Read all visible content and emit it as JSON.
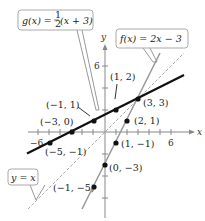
{
  "figure": {
    "axes": {
      "x_label": "x",
      "y_label": "y",
      "x_ticks": [
        "−6",
        "6"
      ],
      "y_ticks": [
        "6"
      ],
      "xlim": [
        -6,
        6
      ],
      "ylim": [
        -6,
        7
      ]
    },
    "functions": {
      "g": {
        "label_lhs": "g(x) = ",
        "label_frac_num": "1",
        "label_frac_den": "2",
        "label_rhs": "(x + 3)",
        "color": "#111111"
      },
      "f": {
        "label": "f(x) = 2x − 3",
        "color": "#999999"
      },
      "identity": {
        "label": "y = x",
        "color": "#aaaaaa",
        "style": "dashed"
      }
    },
    "points_g": [
      {
        "label": "(−5, −1)"
      },
      {
        "label": "(−3, 0)"
      },
      {
        "label": "(−1, 1)"
      },
      {
        "label": "(1, 2)"
      },
      {
        "label": "(3, 3)"
      }
    ],
    "points_f": [
      {
        "label": "(2, 1)"
      },
      {
        "label": "(1, −1)"
      },
      {
        "label": "(0, −3)"
      },
      {
        "label": "(−1, −5)"
      }
    ]
  }
}
